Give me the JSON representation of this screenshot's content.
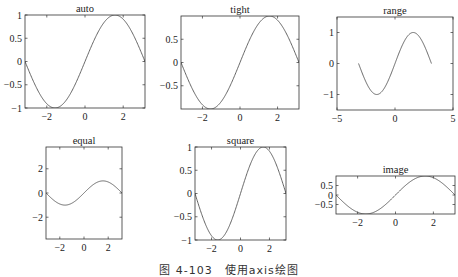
{
  "caption": "图 4-103　使用axis绘图",
  "chart_data": [
    {
      "type": "line",
      "title": "auto",
      "function": "sin(x)",
      "x_range": [
        -3.1416,
        3.1416
      ],
      "xlim": [
        -3.1416,
        3.1416
      ],
      "ylim": [
        -1,
        1
      ],
      "xticks": [
        -2,
        0,
        2
      ],
      "yticks": [
        -1,
        -0.5,
        0,
        0.5,
        1
      ],
      "xticklabels": [
        "−2",
        "0",
        "2"
      ],
      "yticklabels": [
        "−1",
        "−0.5",
        "0",
        "0.5",
        "1"
      ],
      "box": [
        25,
        15,
        145,
        108
      ],
      "grid": false
    },
    {
      "type": "line",
      "title": "tight",
      "function": "sin(x)",
      "x_range": [
        -3.1416,
        3.1416
      ],
      "xlim": [
        -3.1416,
        3.1416
      ],
      "ylim": [
        -1,
        1
      ],
      "xticks": [
        -2,
        0,
        2
      ],
      "yticks": [
        -0.5,
        0,
        0.5
      ],
      "xticklabels": [
        "−2",
        "0",
        "2"
      ],
      "yticklabels": [
        "−0.5",
        "0",
        "0.5"
      ],
      "box": [
        181,
        16,
        299,
        109
      ],
      "grid": false
    },
    {
      "type": "line",
      "title": "range",
      "function": "sin(x)",
      "x_range": [
        -3.1416,
        3.1416
      ],
      "xlim": [
        -5,
        5
      ],
      "ylim": [
        -1.5,
        1.5
      ],
      "xticks": [
        -5,
        0,
        5
      ],
      "yticks": [
        -1,
        0,
        1
      ],
      "xticklabels": [
        "−5",
        "0",
        "5"
      ],
      "yticklabels": [
        "−1",
        "0",
        "1"
      ],
      "box": [
        337,
        17,
        453,
        110
      ],
      "grid": false
    },
    {
      "type": "line",
      "title": "equal",
      "function": "sin(x)",
      "x_range": [
        -3.1416,
        3.1416
      ],
      "xlim": [
        -3.1416,
        3.1416
      ],
      "ylim": [
        -3.8,
        3.8
      ],
      "xticks": [
        -2,
        0,
        2
      ],
      "yticks": [
        -2,
        0,
        2
      ],
      "xticklabels": [
        "−2",
        "0",
        "2"
      ],
      "yticklabels": [
        "−2",
        "0",
        "2"
      ],
      "box": [
        46,
        147,
        122,
        239
      ],
      "grid": false
    },
    {
      "type": "line",
      "title": "square",
      "function": "sin(x)",
      "x_range": [
        -3.1416,
        3.1416
      ],
      "xlim": [
        -3.1416,
        3.1416
      ],
      "ylim": [
        -1,
        1
      ],
      "xticks": [
        -2,
        0,
        2
      ],
      "yticks": [
        -1,
        -0.5,
        0,
        0.5,
        1
      ],
      "xticklabels": [
        "−2",
        "0",
        "2"
      ],
      "yticklabels": [
        "−1",
        "−0.5",
        "0",
        "0.5",
        "1"
      ],
      "box": [
        195,
        147,
        286,
        240
      ],
      "grid": false
    },
    {
      "type": "line",
      "title": "image",
      "function": "sin(x)",
      "x_range": [
        -3.1416,
        3.1416
      ],
      "xlim": [
        -3.1416,
        3.1416
      ],
      "ylim": [
        -1,
        1
      ],
      "xticks": [
        -2,
        0,
        2
      ],
      "yticks": [
        -0.5,
        0,
        0.5
      ],
      "xticklabels": [
        "−2",
        "0",
        "2"
      ],
      "yticklabels": [
        "−0.5",
        "0",
        "0.5"
      ],
      "box": [
        336,
        176,
        455,
        214
      ],
      "grid": false
    }
  ],
  "style": {
    "line_color": "#555555",
    "axis_color": "#333333",
    "tick_font_size": 10,
    "title_font_size": 10.5
  }
}
